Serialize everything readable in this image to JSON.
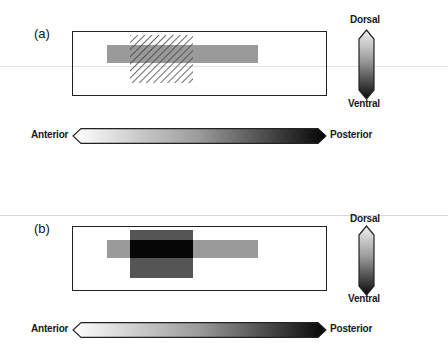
{
  "panels": [
    {
      "id": "a",
      "label": "(a)",
      "overlay_style": "hatched",
      "dorsal_label": "Dorsal",
      "ventral_label": "Ventral",
      "anterior_label": "Anterior",
      "posterior_label": "Posterior"
    },
    {
      "id": "b",
      "label": "(b)",
      "overlay_style": "solid-dark",
      "dorsal_label": "Dorsal",
      "ventral_label": "Ventral",
      "anterior_label": "Anterior",
      "posterior_label": "Posterior"
    }
  ],
  "colors": {
    "gray_bar": "#9a9a9a",
    "dark_square": "#555555",
    "overlap": "#060606",
    "hatch_stroke": "#444444",
    "outline": "#222222"
  }
}
